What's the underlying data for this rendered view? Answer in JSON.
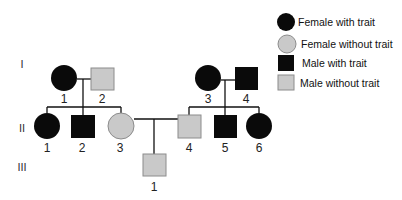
{
  "colors": {
    "affected": "#0a0a0a",
    "unaffected_fill": "#c9c9c9",
    "unaffected_stroke": "#8c8c8c",
    "line": "#111111"
  },
  "legend": {
    "items": [
      {
        "shape": "circle",
        "status": "affected",
        "label": "Female with trait"
      },
      {
        "shape": "circle",
        "status": "unaffected",
        "label": "Female without trait"
      },
      {
        "shape": "square",
        "status": "affected",
        "label": "Male with trait"
      },
      {
        "shape": "square",
        "status": "unaffected",
        "label": "Male without trait"
      }
    ]
  },
  "generations": [
    {
      "label": "I"
    },
    {
      "label": "II"
    },
    {
      "label": "III"
    }
  ],
  "individuals": {
    "I-1": {
      "num": "1",
      "sex": "female",
      "status": "affected"
    },
    "I-2": {
      "num": "2",
      "sex": "male",
      "status": "unaffected"
    },
    "I-3": {
      "num": "3",
      "sex": "female",
      "status": "affected"
    },
    "I-4": {
      "num": "4",
      "sex": "male",
      "status": "affected"
    },
    "II-1": {
      "num": "1",
      "sex": "female",
      "status": "affected"
    },
    "II-2": {
      "num": "2",
      "sex": "male",
      "status": "affected"
    },
    "II-3": {
      "num": "3",
      "sex": "female",
      "status": "unaffected"
    },
    "II-4": {
      "num": "4",
      "sex": "male",
      "status": "unaffected"
    },
    "II-5": {
      "num": "5",
      "sex": "male",
      "status": "affected"
    },
    "II-6": {
      "num": "6",
      "sex": "female",
      "status": "affected"
    },
    "III-1": {
      "num": "1",
      "sex": "male",
      "status": "unaffected"
    }
  },
  "pedigree": {
    "matings": [
      {
        "partners": [
          "I-1",
          "I-2"
        ],
        "children": [
          "II-1",
          "II-2",
          "II-3"
        ]
      },
      {
        "partners": [
          "I-3",
          "I-4"
        ],
        "children": [
          "II-4",
          "II-5",
          "II-6"
        ]
      },
      {
        "partners": [
          "II-3",
          "II-4"
        ],
        "children": [
          "III-1"
        ]
      }
    ]
  }
}
